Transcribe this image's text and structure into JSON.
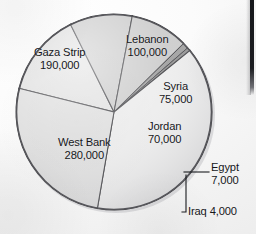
{
  "figure": {
    "alt_title": "Palestinian refugee population by location",
    "background_color": "#f2f2f2",
    "page_edge_color": "#15161a"
  },
  "chart_data": {
    "type": "pie",
    "title": "",
    "xlabel": "",
    "ylabel": "",
    "legend_position": "none",
    "labels_placement": "inside-and-callout",
    "total": 726000,
    "start_angle_deg": -76,
    "direction": "clockwise",
    "categories": [
      "Lebanon",
      "Syria",
      "Jordan",
      "Egypt",
      "Iraq",
      "West Bank",
      "Gaza Strip"
    ],
    "values": [
      100000,
      75000,
      70000,
      7000,
      4000,
      280000,
      190000
    ],
    "value_labels": [
      "100,000",
      "75,000",
      "70,000",
      "7,000",
      "4,000",
      "280,000",
      "190,000"
    ],
    "slice_colors": [
      "#e0e0e0",
      "#c9c9c9",
      "#c9c9c9",
      "#9a9a9a",
      "#8d8d8d",
      "#ececec",
      "#dedede"
    ],
    "slices": [
      {
        "name": "Lebanon",
        "value": 100000,
        "value_label": "100,000",
        "label_mode": "inside",
        "fill": "#e0e0e0"
      },
      {
        "name": "Syria",
        "value": 75000,
        "value_label": "75,000",
        "label_mode": "inside",
        "fill": "#c9c9c9"
      },
      {
        "name": "Jordan",
        "value": 70000,
        "value_label": "70,000",
        "label_mode": "inside",
        "fill": "#c9c9c9"
      },
      {
        "name": "Egypt",
        "value": 7000,
        "value_label": "7,000",
        "label_mode": "callout",
        "fill": "#9a9a9a"
      },
      {
        "name": "Iraq",
        "value": 4000,
        "value_label": "4,000",
        "label_mode": "callout",
        "fill": "#8d8d8d"
      },
      {
        "name": "West Bank",
        "value": 280000,
        "value_label": "280,000",
        "label_mode": "inside",
        "fill": "#ececec"
      },
      {
        "name": "Gaza Strip",
        "value": 190000,
        "value_label": "190,000",
        "label_mode": "inside",
        "fill": "#dedede"
      }
    ]
  },
  "labels": {
    "gaza": {
      "name": "Gaza Strip",
      "value": "190,000"
    },
    "lebanon": {
      "name": "Lebanon",
      "value": "100,000"
    },
    "syria": {
      "name": "Syria",
      "value": "75,000"
    },
    "jordan": {
      "name": "Jordan",
      "value": "70,000"
    },
    "west_bank": {
      "name": "West Bank",
      "value": "280,000"
    },
    "egypt": {
      "name": "Egypt",
      "value": "7,000"
    },
    "iraq": {
      "name": "Iraq ",
      "value": "4,000"
    }
  }
}
